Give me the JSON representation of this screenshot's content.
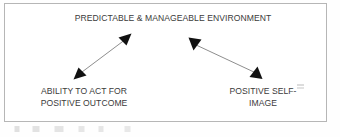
{
  "diagram": {
    "title": "PREDICTABLE & MANAGEABLE ENVIRONMENT",
    "nodes": [
      {
        "id": "environment",
        "label": "PREDICTABLE & MANAGEABLE ENVIRONMENT",
        "position": "top-center"
      },
      {
        "id": "ability",
        "label": "ABILITY TO ACT FOR\nPOSITIVE OUTCOME",
        "position": "bottom-left"
      },
      {
        "id": "self_image",
        "label": "POSITIVE SELF-\nIMAGE",
        "position": "bottom-right"
      }
    ],
    "connectors": [
      {
        "id": "ability-environment",
        "from": "ability",
        "to": "environment",
        "style": "double-headed-arrow",
        "color": "#8e8e8e",
        "head_color": "#111111"
      },
      {
        "id": "environment-self-image",
        "from": "environment",
        "to": "self_image",
        "style": "double-headed-arrow",
        "color": "#8e8e8e",
        "head_color": "#111111"
      }
    ],
    "frame": {
      "border_color": "#b6b6b6",
      "background": "#ffffff"
    },
    "text_color": "#3b3b3b"
  }
}
